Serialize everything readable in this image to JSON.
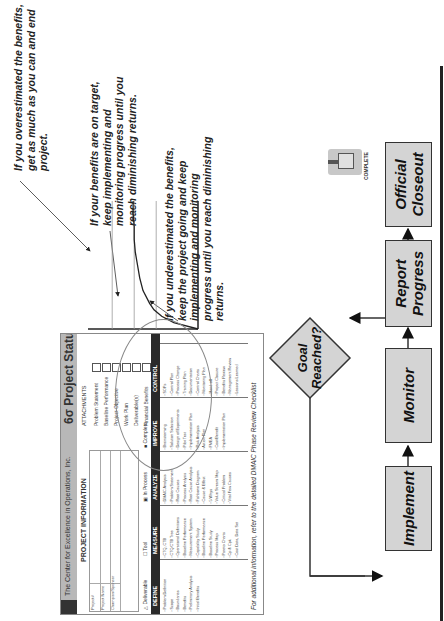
{
  "annotations": {
    "overestimated": "If you overestimated the benefits, get as much as you can and end project.",
    "on_target": "If your benefits are on target, keep implementing and monitoring progress until you reach diminishing returns.",
    "underestimated": "If you underestimated the benefits, keep the project going and keep implementing and monitoring progress until you reach diminishing returns."
  },
  "status_form": {
    "organization": "The Center for Excellence in Operations, Inc.",
    "title": "6σ Project Status",
    "project_information": {
      "heading": "PROJECT INFORMATION",
      "fields": [
        "Project#",
        "Project Name",
        "Champion/Sponsor"
      ]
    },
    "attachments": {
      "heading": "ATTACHMENTS",
      "items": [
        "Problem Statement",
        "Baseline Performance",
        "Project Objective",
        "Work Plan",
        "Deliverable(s)",
        "Financial Benefits"
      ]
    },
    "legend": {
      "deliverable": "Deliverable",
      "tool": "Tool",
      "in_process": "In Process",
      "complete": "Complete"
    },
    "phases": [
      {
        "name": "DEFINE",
        "items": [
          "Problem Definition",
          "Scope",
          "Boundaries",
          "Benefits",
          "Preliminary Analysis",
          "Initial Benefits"
        ]
      },
      {
        "name": "MEASURE",
        "items": [
          "CTQ, CTB",
          "CTQ/CTB Tree",
          "Operational Definitions",
          "Baseline Performance",
          "Measurement System",
          "Capability Study",
          "Baseline Performance",
          "Baseline Study",
          "Process Map",
          "Pareto Charts",
          "Cp & Cpk",
          "Cost Data, Data Set"
        ]
      },
      {
        "name": "ANALYZE",
        "items": [
          "DMAIC Analysis",
          "Problem Statement",
          "Root Causes",
          "Process Analysis",
          "Root Cause Analysis",
          "Fishbone Diagram",
          "Cause & Effect",
          "5 Whys",
          "Value Stream Map",
          "Critical Problem",
          "Vital Few Causes"
        ]
      },
      {
        "name": "IMPROVE",
        "items": [
          "Brainstorming",
          "Solution Selection",
          "Design of Experiments",
          "Pilot Test",
          "Implementation Plan",
          "Risk Analysis",
          "Action Plan",
          "FMEA",
          "Cost/Benefit",
          "Implementation Plan"
        ]
      },
      {
        "name": "CONTROL",
        "items": [
          "SOPs",
          "Control Plan",
          "Process Change",
          "Training Plan",
          "Documentation",
          "Control Charts",
          "Monitoring Plan",
          "Hand-off",
          "Project Closure",
          "Benefits Review",
          "Management Review",
          "Lessons Learned"
        ]
      }
    ],
    "footer": "For additional information, refer to the detailed DMAIC Phase Review Checklist"
  },
  "chart_data": {
    "type": "line",
    "title": "",
    "xlabel": "",
    "ylabel": "",
    "x": [
      0,
      0.05,
      0.1,
      0.15,
      0.2,
      0.3,
      0.4,
      0.5,
      0.6,
      0.7,
      0.8,
      0.9,
      1.0
    ],
    "series": [
      {
        "name": "benefits",
        "values": [
          0,
          0.22,
          0.33,
          0.4,
          0.44,
          0.5,
          0.53,
          0.55,
          0.57,
          0.58,
          0.58,
          0.59,
          0.59
        ]
      }
    ],
    "reference_lines": [
      {
        "name": "overestimated",
        "value": 0.78
      },
      {
        "name": "on-target",
        "value": 0.58
      },
      {
        "name": "underestimated",
        "value": 0.38
      }
    ],
    "xlim": [
      0,
      1
    ],
    "ylim": [
      0,
      1
    ],
    "grid": false
  },
  "flowchart": {
    "steps": [
      "Implement",
      "Monitor",
      "Report Progress",
      "Official Closeout"
    ],
    "decision": "Goal Reached?",
    "badge": "COMPLETE",
    "colors": {
      "box_fill": "#d4d4d4",
      "border": "#333333"
    }
  }
}
